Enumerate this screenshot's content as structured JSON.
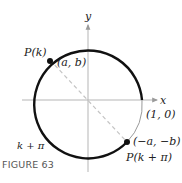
{
  "diagram": {
    "type": "unit-circle",
    "caption": "FIGURE 63",
    "axes": {
      "x_label": "x",
      "y_label": "y"
    },
    "points": {
      "p": {
        "name": "P(k)",
        "coords": "(a, b)"
      },
      "q": {
        "name": "P(k + π)",
        "coords": "(−a, −b)"
      },
      "unit": {
        "coords": "(1, 0)"
      }
    },
    "arc_label": "k + π",
    "colors": {
      "circle_thick": "#111111",
      "circle_thin": "#9a9a9a",
      "axis": "#b5b5b5",
      "dashed_line": "#c4c4c4",
      "point": "#111111"
    }
  }
}
